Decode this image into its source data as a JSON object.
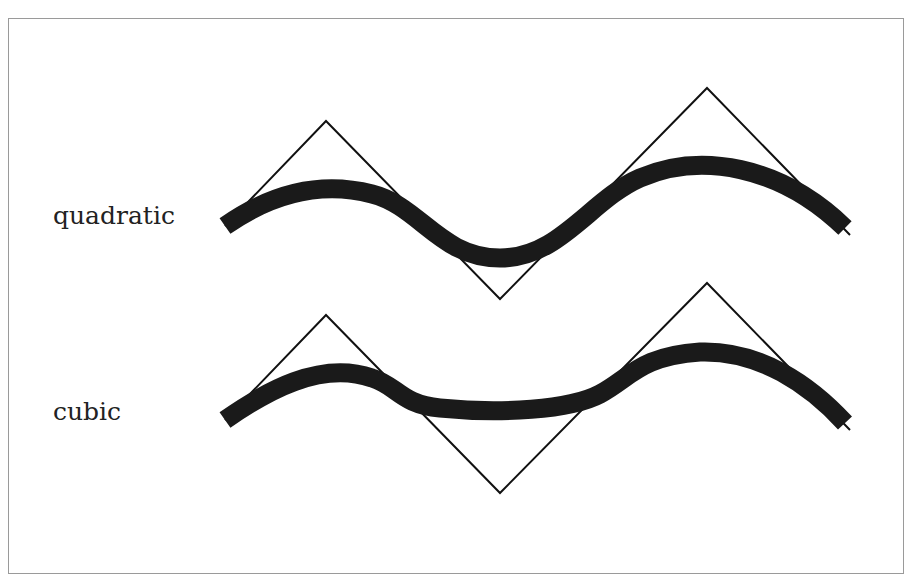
{
  "figure": {
    "rows": [
      {
        "label": "quadratic",
        "control_polygon": [
          [
            225,
            226
          ],
          [
            326,
            121
          ],
          [
            500,
            299
          ],
          [
            707,
            88
          ],
          [
            850,
            235
          ]
        ],
        "curve_path": "M225,226 C268,196 318,180 372,194 C420,206 440,258 500,258 C560,258 590,200 640,178 C700,152 780,165 845,228"
      },
      {
        "label": "cubic",
        "control_polygon": [
          [
            225,
            420
          ],
          [
            326,
            315
          ],
          [
            500,
            493
          ],
          [
            707,
            283
          ],
          [
            850,
            430
          ]
        ],
        "curve_path": "M225,420 C265,392 320,360 372,378 C398,386 400,404 440,408 C500,414 570,410 600,394 C630,378 640,356 700,352 C760,350 810,385 845,423"
      }
    ],
    "colors": {
      "curve": "#1a1a1a",
      "polygon": "#111111",
      "frame": "#9a9a9a",
      "label": "#222222"
    }
  }
}
